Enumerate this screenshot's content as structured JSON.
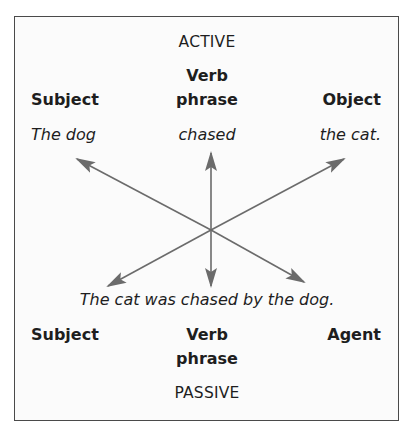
{
  "diagram": {
    "type": "active-passive-voice-transformation",
    "colors": {
      "border": "#4a4a4a",
      "arrow": "#6b6b6b",
      "text": "#1e1e1e",
      "background": "#fbfbfb"
    },
    "active": {
      "heading": "ACTIVE",
      "columns": [
        {
          "role": "Subject",
          "example": "The dog"
        },
        {
          "role_line1": "Verb",
          "role_line2": "phrase",
          "example": "chased"
        },
        {
          "role": "Object",
          "example": "the cat."
        }
      ]
    },
    "passive": {
      "heading": "PASSIVE",
      "sentence": "The cat was chased by the dog.",
      "columns": [
        {
          "role": "Subject"
        },
        {
          "role_line1": "Verb",
          "role_line2": "phrase"
        },
        {
          "role": "Agent"
        }
      ]
    },
    "arrows": [
      {
        "from": "Active Subject",
        "to": "Passive Agent",
        "direction": "bidirectional"
      },
      {
        "from": "Active Verb phrase",
        "to": "Passive Verb phrase",
        "direction": "bidirectional"
      },
      {
        "from": "Active Object",
        "to": "Passive Subject",
        "direction": "bidirectional"
      }
    ]
  }
}
